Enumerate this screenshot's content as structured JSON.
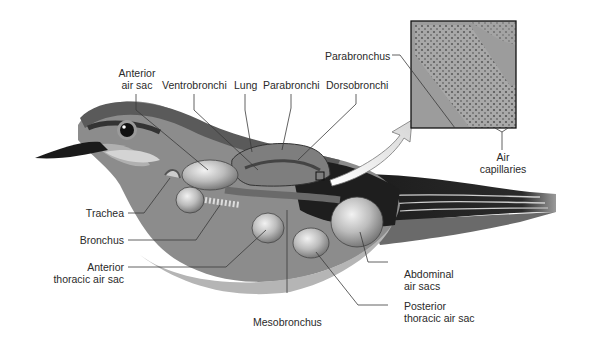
{
  "figure": {
    "colors": {
      "background": "#ffffff",
      "label_text": "#2a2a2a",
      "leader_line": "#3a3a3a",
      "body_gray": "#8c8c8c",
      "dark_wing": "#1e1e1e",
      "air_sac": "#bdbdbd",
      "inset_fill": "#9a9a9a"
    },
    "labels": {
      "anterior_air_sac": [
        "Anterior",
        "air sac"
      ],
      "ventrobronchi": "Ventrobronchi",
      "lung": "Lung",
      "parabronchi": "Parabronchi",
      "dorsobronchi": "Dorsobronchi",
      "parabronchus": "Parabronchus",
      "air_capillaries": [
        "Air",
        "capillaries"
      ],
      "trachea": "Trachea",
      "bronchus": "Bronchus",
      "anterior_thoracic_air_sac": [
        "Anterior",
        "thoracic air sac"
      ],
      "mesobronchus": "Mesobronchus",
      "abdominal_air_sacs": [
        "Abdominal",
        "air sacs"
      ],
      "posterior_thoracic_air_sac": [
        "Posterior",
        "thoracic air sac"
      ]
    },
    "inset": {
      "description": "magnified view of parabronchus tissue with air capillaries",
      "icon": "zoom-arrow-icon"
    }
  }
}
